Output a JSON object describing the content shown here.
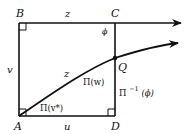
{
  "diagram": {
    "type": "geometry-figure",
    "points": {
      "A": "A",
      "B": "B",
      "C": "C",
      "D": "D",
      "Q": "Q"
    },
    "side_labels": {
      "BC": "z",
      "AB": "v",
      "AD": "u",
      "AQ": "z"
    },
    "angle_labels": {
      "at_C": "ϕ",
      "at_Q": "Π(w)",
      "at_A": "Π(v*)",
      "CD_side": "Π",
      "CD_side_sup": "−1",
      "CD_side_arg": "(ϕ)"
    },
    "colors": {
      "stroke": "#111111",
      "background": "#ffffff"
    }
  }
}
